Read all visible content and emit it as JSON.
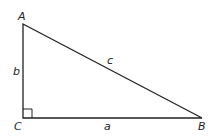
{
  "diagram": {
    "type": "right-triangle",
    "vertices": {
      "A": {
        "label": "A",
        "x": 23,
        "y": 24
      },
      "C": {
        "label": "C",
        "x": 23,
        "y": 118
      },
      "B": {
        "label": "B",
        "x": 202,
        "y": 118
      }
    },
    "sides": {
      "a": {
        "label": "a",
        "between": [
          "C",
          "B"
        ]
      },
      "b": {
        "label": "b",
        "between": [
          "A",
          "C"
        ]
      },
      "c": {
        "label": "c",
        "between": [
          "A",
          "B"
        ]
      }
    },
    "right_angle_at": "C",
    "colors": {
      "stroke": "#222222",
      "background": "#ffffff"
    }
  }
}
